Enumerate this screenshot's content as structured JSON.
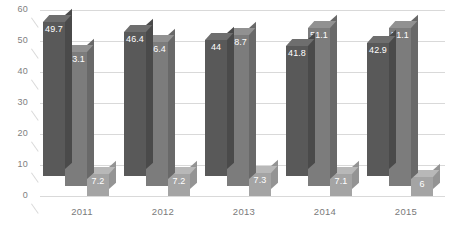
{
  "chart_data": {
    "type": "bar",
    "title": "",
    "subtitle": "",
    "xlabel": "",
    "ylabel": "",
    "categories": [
      "2011",
      "2012",
      "2013",
      "2014",
      "2015"
    ],
    "yticks": [
      "0",
      "10",
      "20",
      "30",
      "40",
      "50",
      "60"
    ],
    "ylim": [
      0,
      60
    ],
    "grid": true,
    "legend": "none",
    "style": "3d-clustered-column",
    "series": [
      {
        "name": "Series 1",
        "color": "#595959",
        "values": [
          49.7,
          46.4,
          44,
          41.8,
          42.9
        ],
        "labels": [
          "49.7",
          "46.4",
          "44",
          "41.8",
          "42.9"
        ]
      },
      {
        "name": "Series 2",
        "color": "#7c7c7c",
        "values": [
          43.1,
          46.4,
          48.7,
          51.1,
          51.1
        ],
        "labels": [
          "43.1",
          "46.4",
          "48.7",
          "51.1",
          "51.1"
        ]
      },
      {
        "name": "Series 3",
        "color": "#a4a4a4",
        "values": [
          7.2,
          7.2,
          7.3,
          7.1,
          6
        ],
        "labels": [
          "7.2",
          "7.2",
          "7.3",
          "7.1",
          "6"
        ]
      }
    ]
  },
  "axis": {
    "y": {
      "t0": "0",
      "t1": "10",
      "t2": "20",
      "t3": "30",
      "t4": "40",
      "t5": "50",
      "t6": "60"
    },
    "x": {
      "c0": "2011",
      "c1": "2012",
      "c2": "2013",
      "c3": "2014",
      "c4": "2015"
    }
  },
  "labels": {
    "g0": {
      "s0": "49.7",
      "s1": "43.1",
      "s2": "7.2"
    },
    "g1": {
      "s0": "46.4",
      "s1": "46.4",
      "s2": "7.2"
    },
    "g2": {
      "s0": "44",
      "s1": "48.7",
      "s2": "7.3"
    },
    "g3": {
      "s0": "41.8",
      "s1": "51.1",
      "s2": "7.1"
    },
    "g4": {
      "s0": "42.9",
      "s1": "51.1",
      "s2": "6"
    }
  },
  "colors": {
    "series1": "#595959",
    "series2": "#7c7c7c",
    "series3": "#a4a4a4",
    "grid": "#d9d9d9",
    "axis_text": "#808080",
    "background": "#ffffff"
  }
}
